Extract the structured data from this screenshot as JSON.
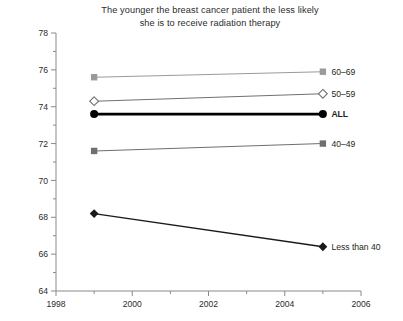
{
  "chart_data": {
    "type": "line",
    "title": "The younger the breast cancer patient the less likely she is to receive radiation therapy",
    "title_line1": "The younger the breast cancer patient the less likely",
    "title_line2": "she is to receive radiation therapy",
    "xlabel": "",
    "ylabel": "Percent",
    "xlim": [
      1998,
      2006
    ],
    "ylim": [
      64,
      78
    ],
    "x": [
      1999,
      2005
    ],
    "xticks": [
      1998,
      2000,
      2002,
      2004,
      2006
    ],
    "xtick_labels": [
      "1998",
      "2000",
      "2002",
      "2004",
      "2006"
    ],
    "xminor_ticks": [
      1999,
      2001,
      2003,
      2005
    ],
    "yticks": [
      64,
      66,
      68,
      70,
      72,
      74,
      76,
      78
    ],
    "ytick_labels": [
      "64",
      "66",
      "68",
      "70",
      "72",
      "74",
      "76",
      "78"
    ],
    "yminor_ticks": [
      65,
      67,
      69,
      71,
      73,
      75,
      77
    ],
    "grid": false,
    "legend_position": "right-inline",
    "series": [
      {
        "name": "60–69",
        "values": [
          75.6,
          75.9
        ],
        "marker": "square",
        "color": "#9a9a9a",
        "line_width": 1.1,
        "bold": false
      },
      {
        "name": "50–59",
        "values": [
          74.3,
          74.7
        ],
        "marker": "diamond-open",
        "color": "#707070",
        "line_width": 1.1,
        "bold": false
      },
      {
        "name": "ALL",
        "values": [
          73.6,
          73.6
        ],
        "marker": "circle",
        "color": "#000000",
        "line_width": 2.6,
        "bold": true
      },
      {
        "name": "40–49",
        "values": [
          71.6,
          72.0
        ],
        "marker": "square",
        "color": "#6f6f6f",
        "line_width": 1.1,
        "bold": false
      },
      {
        "name": "Less than 40",
        "values": [
          68.2,
          66.4
        ],
        "marker": "diamond",
        "color": "#1a1a1a",
        "line_width": 1.4,
        "bold": false
      }
    ]
  },
  "axis": {
    "color": "#8a8a8a"
  }
}
